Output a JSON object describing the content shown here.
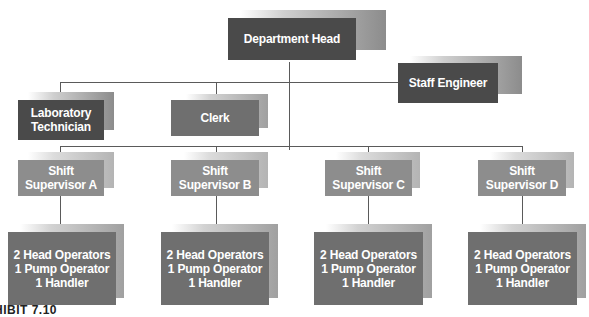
{
  "chart": {
    "type": "org-chart",
    "nodes": {
      "department_head": "Department Head",
      "staff_engineer": "Staff Engineer",
      "lab_tech": "Laboratory\nTechnician",
      "clerk": "Clerk",
      "supervisors": [
        "Shift\nSupervisor A",
        "Shift\nSupervisor B",
        "Shift\nSupervisor C",
        "Shift\nSupervisor D"
      ],
      "crews": [
        "2 Head Operators\n1 Pump Operator\n1 Handler",
        "2 Head Operators\n1 Pump Operator\n1 Handler",
        "2 Head Operators\n1 Pump Operator\n1 Handler",
        "2 Head Operators\n1 Pump Operator\n1 Handler"
      ]
    },
    "caption": "HIBIT 7.10"
  },
  "colors": {
    "dark": "#4a4a4a",
    "mid": "#6f6f6f",
    "light": "#8d8d8d",
    "line": "#5a5a5a"
  }
}
